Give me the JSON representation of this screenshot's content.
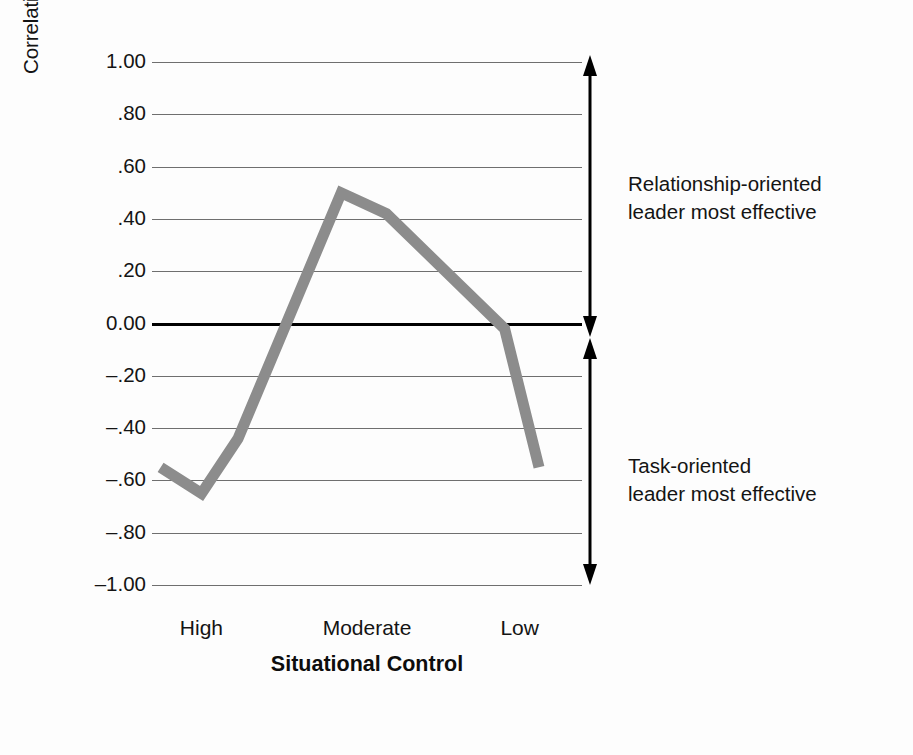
{
  "axes": {
    "ylabel": "Correlation of Leadership Style and Group Performance",
    "xlabel": "Situational Control",
    "yticks": [
      "1.00",
      ".80",
      ".60",
      ".40",
      ".20",
      "0.00",
      "–.20",
      "–.40",
      "–.60",
      "–.80",
      "–1.00"
    ],
    "xticks": [
      "High",
      "Moderate",
      "Low"
    ]
  },
  "annotations": {
    "top_line1": "Relationship-oriented",
    "top_line2": "leader most effective",
    "bottom_line1": "Task-oriented",
    "bottom_line2": "leader most effective"
  },
  "colors": {
    "line": "#8c8c8c",
    "grid": "#6f6f6f",
    "zero_line": "#000000",
    "text": "#141414",
    "background": "#fdfdfd"
  },
  "chart_data": {
    "type": "line",
    "title": "",
    "xlabel": "Situational Control",
    "ylabel": "Correlation of Leadership Style and Group Performance",
    "ylim": [
      -1.0,
      1.0
    ],
    "ytick_values": [
      1.0,
      0.8,
      0.6,
      0.4,
      0.2,
      0.0,
      -0.2,
      -0.4,
      -0.6,
      -0.8,
      -1.0
    ],
    "xtick_labels": [
      "High",
      "Moderate",
      "Low"
    ],
    "xtick_positions": [
      0.115,
      0.5,
      0.855
    ],
    "grid": true,
    "legend": "none",
    "series": [
      {
        "name": "Correlation of leadership style and group performance",
        "x": [
          0.02,
          0.115,
          0.2,
          0.44,
          0.545,
          0.82,
          0.9
        ],
        "values": [
          -0.55,
          -0.65,
          -0.44,
          0.5,
          0.42,
          -0.02,
          -0.55
        ]
      }
    ],
    "annotations": [
      {
        "text": "Relationship-oriented leader most effective",
        "y_range": [
          0.0,
          1.0
        ]
      },
      {
        "text": "Task-oriented leader most effective",
        "y_range": [
          -1.0,
          0.0
        ]
      }
    ]
  }
}
